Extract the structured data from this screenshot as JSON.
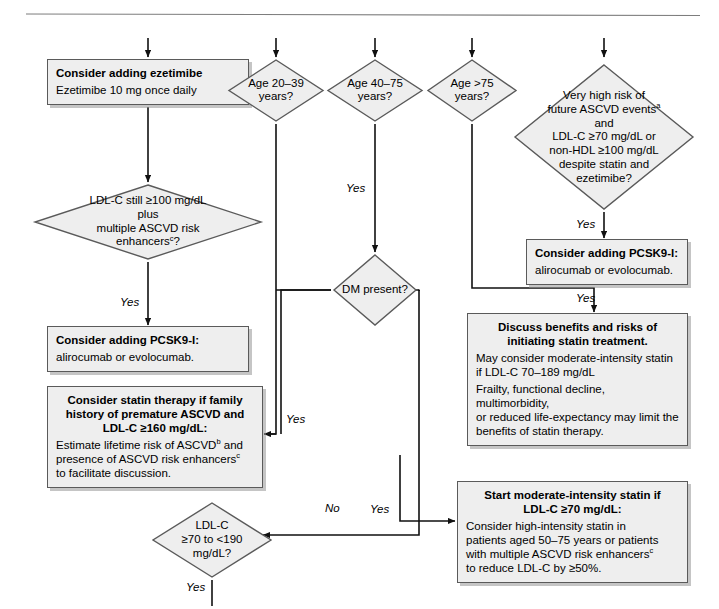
{
  "diagram": {
    "type": "clinical-decision-flowchart",
    "topic": "Lipid management / statin and non-statin therapy decision algorithm",
    "fill_color": "#eeeeee",
    "border_color": "#5a5a5a",
    "background": "#ffffff"
  },
  "nodes": {
    "ezetimibe_box": {
      "title": "Consider adding ezetimibe",
      "body": "Ezetimibe 10 mg once daily"
    },
    "ldl100_diamond": {
      "line1": "LDL-C still ≥100 mg/dL",
      "line2": "plus",
      "line3": "multiple ASCVD risk",
      "line4": "enhancers",
      "line4_sup": "c",
      "line4_tail": "?"
    },
    "pcsk9_left_box": {
      "title": "Consider adding PCSK9-I:",
      "body": "alirocumab or evolocumab."
    },
    "family_history_box": {
      "title_line1": "Consider statin therapy if family",
      "title_line2": "history of premature ASCVD and",
      "title_line3": "LDL-C ≥160 mg/dL:",
      "body_line1_a": "Estimate lifetime risk of ASCVD",
      "body_line1_sup": "b",
      "body_line1_b": " and",
      "body_line2_a": "presence of ASCVD risk enhancers",
      "body_line2_sup": "c",
      "body_line3": "to facilitate discussion."
    },
    "age_20_39_diamond": {
      "line1": "Age 20–39",
      "line2": "years?"
    },
    "age_40_75_diamond": {
      "line1": "Age 40–75",
      "line2": "years?"
    },
    "age_over_75_diamond": {
      "line1": "Age >75",
      "line2": "years?"
    },
    "dm_present_diamond": {
      "line1": "DM present?"
    },
    "very_high_risk_diamond": {
      "line1": "Very high risk of",
      "line2_a": "future ASCVD events",
      "line2_sup": "a",
      "line3": "and",
      "line4": "LDL-C ≥70 mg/dL or",
      "line5": "non-HDL ≥100 mg/dL",
      "line6": "despite statin and",
      "line7": "ezetimibe?"
    },
    "pcsk9_right_box": {
      "title": "Consider adding PCSK9-I:",
      "body": "alirocumab or evolocumab."
    },
    "discuss_benefits_box": {
      "title_line1": "Discuss benefits and risks of",
      "title_line2": "initiating statin treatment.",
      "para1_line1": "May consider moderate-intensity statin",
      "para1_line2": "if LDL-C 70–189 mg/dL",
      "para2_line1": "Frailty, functional decline, multimorbidity,",
      "para2_line2": "or reduced life-expectancy may limit the",
      "para2_line3": "benefits of statin therapy."
    },
    "ldl70_190_diamond": {
      "line1": "LDL-C",
      "line2": "≥70 to <190",
      "line3": "mg/dL?"
    },
    "start_moderate_box": {
      "title_line1": "Start moderate-intensity statin if",
      "title_line2": "LDL-C ≥70 mg/dL:",
      "body_line1": "Consider high-intensity statin in",
      "body_line2": "patients aged 50–75 years or patients",
      "body_line3_a": "with multiple ASCVD risk enhancers",
      "body_line3_sup": "c",
      "body_line4": "to reduce LDL-C by ≥50%."
    }
  },
  "edge_labels": {
    "ldl100_yes": "Yes",
    "age_40_75_yes": "Yes",
    "very_high_risk_yes": "Yes",
    "age_over_75_yes": "Yes",
    "dm_no": "No",
    "dm_yes_left": "Yes",
    "dm_yes_right": "Yes",
    "ldl70_190_yes": "Yes"
  }
}
